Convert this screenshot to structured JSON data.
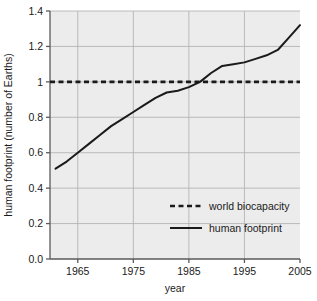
{
  "chart_data": {
    "type": "line",
    "title": "",
    "xlabel": "year",
    "ylabel": "human footprint (number of Earths)",
    "xlim": [
      1960,
      2005
    ],
    "ylim": [
      0.0,
      1.4
    ],
    "grid": true,
    "legend_position": "lower-right-inside",
    "x_ticks": [
      "1965",
      "1975",
      "1985",
      "1995",
      "2005"
    ],
    "x_tick_values": [
      1965,
      1975,
      1985,
      1995,
      2005
    ],
    "y_ticks": [
      "0.0",
      "0.2",
      "0.4",
      "0.6",
      "0.8",
      "1",
      "1.2",
      "1.4"
    ],
    "y_tick_values": [
      0.0,
      0.2,
      0.4,
      0.6,
      0.8,
      1.0,
      1.2,
      1.4
    ],
    "series": [
      {
        "name": "world biocapacity",
        "style": "dashed",
        "color": "#1a1a1a",
        "x": [
          1960,
          2005
        ],
        "values": [
          1.0,
          1.0
        ]
      },
      {
        "name": "human footprint",
        "style": "solid",
        "color": "#1a1a1a",
        "x": [
          1961,
          1963,
          1965,
          1967,
          1969,
          1971,
          1973,
          1975,
          1977,
          1979,
          1981,
          1983,
          1985,
          1987,
          1989,
          1991,
          1993,
          1995,
          1997,
          1999,
          2001,
          2003,
          2005
        ],
        "values": [
          0.51,
          0.55,
          0.6,
          0.65,
          0.7,
          0.75,
          0.79,
          0.83,
          0.87,
          0.91,
          0.94,
          0.95,
          0.97,
          1.0,
          1.05,
          1.09,
          1.1,
          1.11,
          1.13,
          1.15,
          1.18,
          1.25,
          1.32
        ]
      }
    ]
  },
  "legend": {
    "entries": [
      {
        "label": "world biocapacity",
        "style": "dashed"
      },
      {
        "label": "human footprint",
        "style": "solid"
      }
    ]
  },
  "colors": {
    "line": "#1a1a1a",
    "grid": "#b4b4b4",
    "axis": "#5a5a5a",
    "plot_background": "#ececec",
    "figure_background": "#ffffff"
  }
}
